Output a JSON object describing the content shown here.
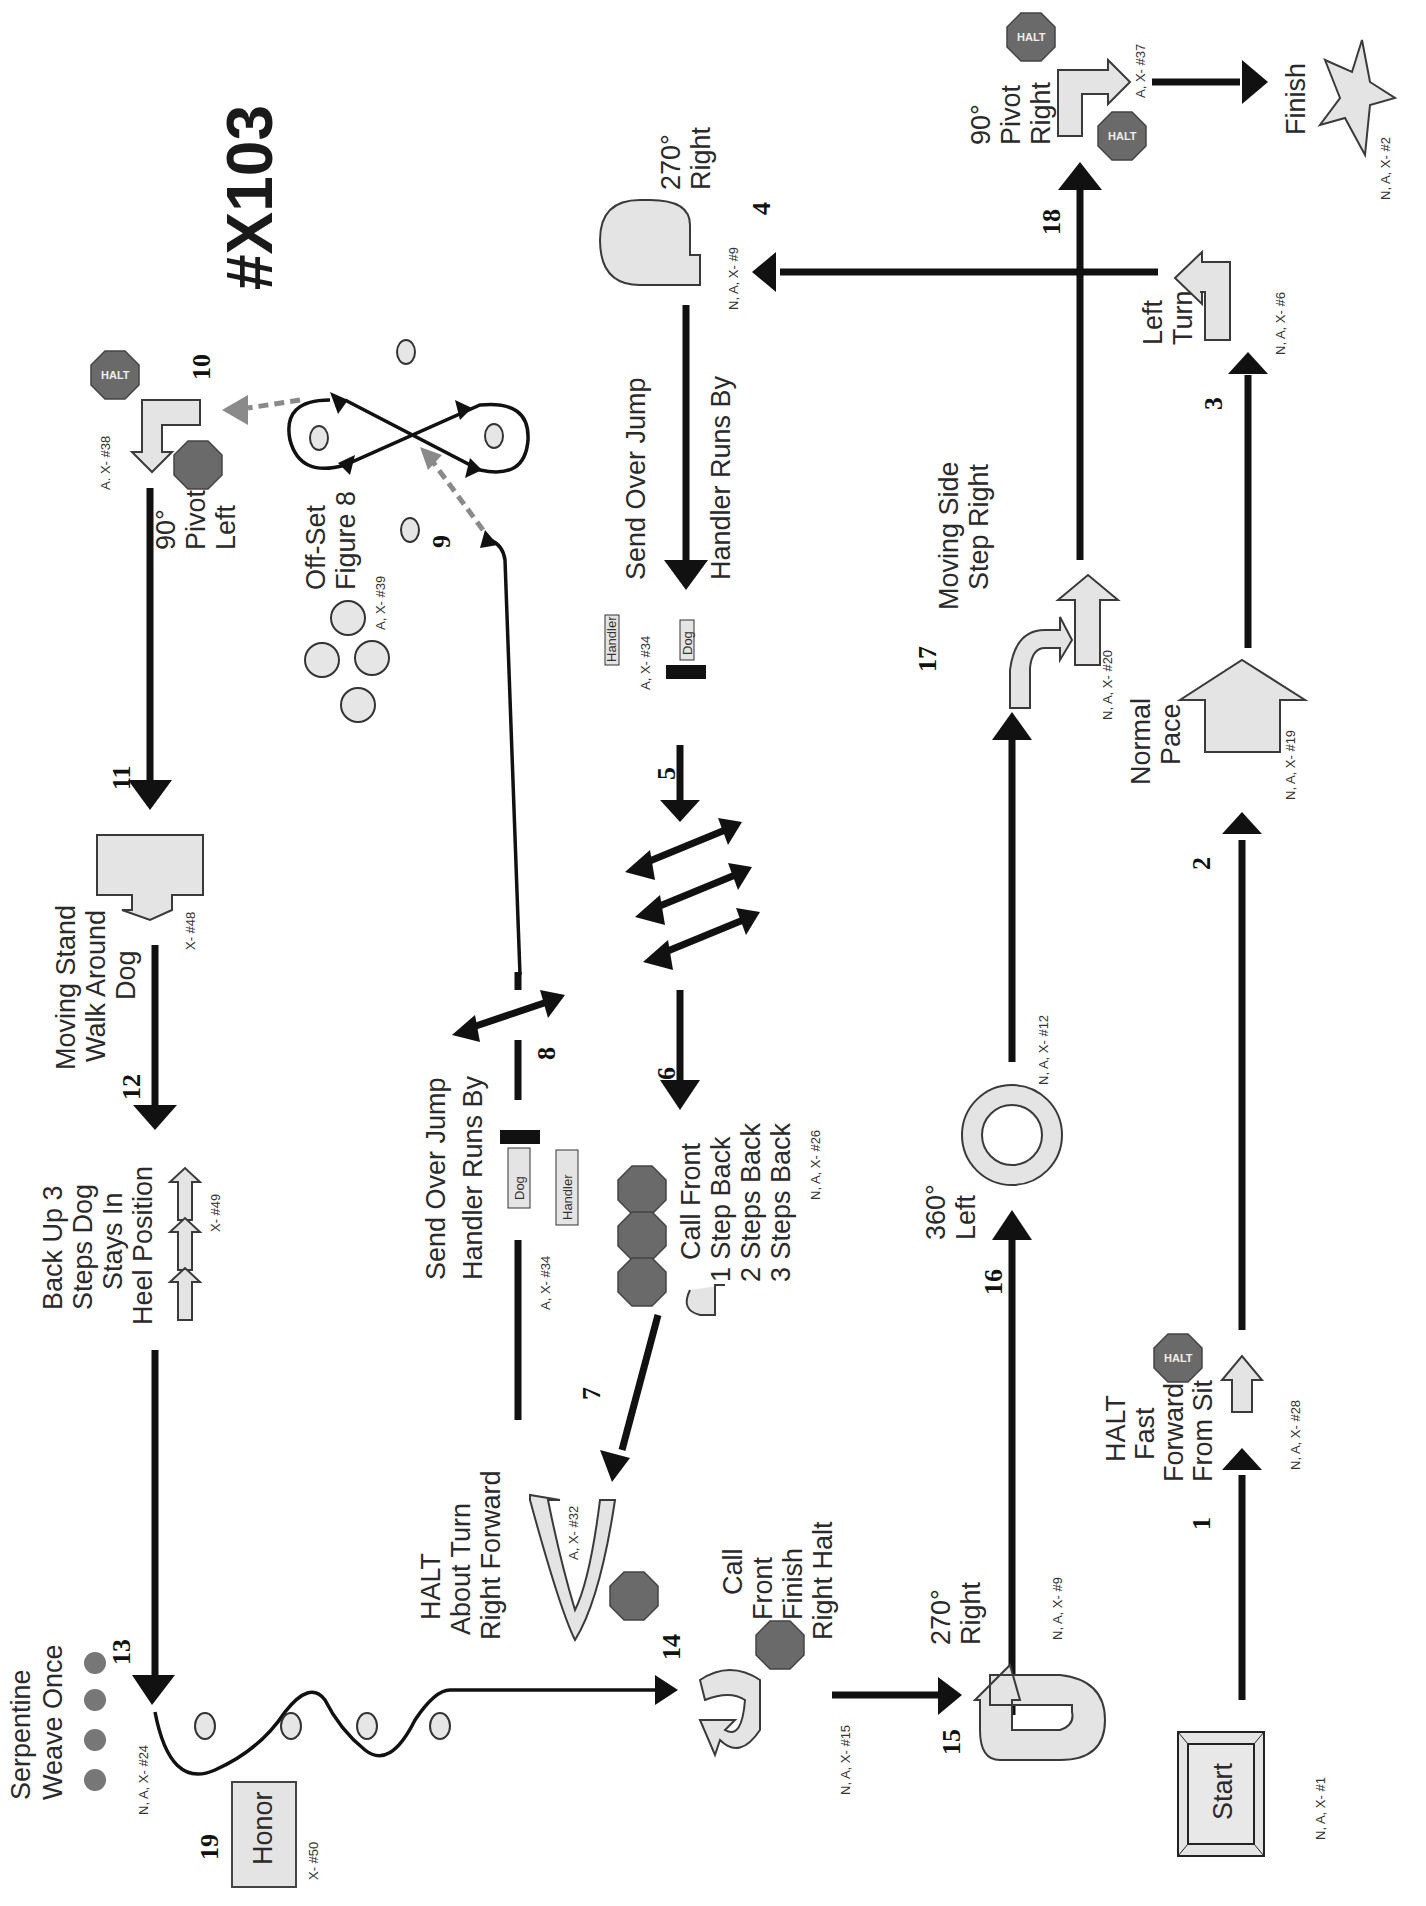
{
  "title": "#X103",
  "stations": [
    {
      "num": "1",
      "label": [
        "HALT",
        "Fast",
        "Forward",
        "From Sit"
      ],
      "code": "N, A, X- #28"
    },
    {
      "num": "2",
      "label": [
        "Normal",
        "Pace"
      ],
      "code": "N, A, X- #19"
    },
    {
      "num": "3",
      "label": [
        "Left",
        "Turn"
      ],
      "code": "N, A, X- #6"
    },
    {
      "num": "4",
      "label": [
        "270°",
        "Right"
      ],
      "code": "N, A, X- #9"
    },
    {
      "num": "5",
      "label": [
        "Send Over Jump",
        "Handler Runs By"
      ],
      "code": "A, X- #34"
    },
    {
      "num": "6",
      "label": [
        "Call Front",
        "1 Step Back",
        "2 Steps Back",
        "3 Steps Back"
      ],
      "code": "N, A, X- #26"
    },
    {
      "num": "7",
      "label": [
        "HALT",
        "About Turn",
        "Right Forward"
      ],
      "code": "A, X- #32"
    },
    {
      "num": "8",
      "label": [
        "Send Over Jump",
        "Handler Runs By"
      ],
      "code": "A, X- #34"
    },
    {
      "num": "9",
      "label": [
        "Off-Set",
        "Figure 8"
      ],
      "code": "A, X- #39"
    },
    {
      "num": "10",
      "label": [
        "90°",
        "Pivot",
        "Left"
      ],
      "code": "A. X- #38"
    },
    {
      "num": "11",
      "label": [
        "Moving Stand",
        "Walk Around",
        "Dog"
      ],
      "code": "X- #48"
    },
    {
      "num": "12",
      "label": [
        "Back Up 3",
        "Steps Dog",
        "Stays In",
        "Heel Position"
      ],
      "code": "X- #49"
    },
    {
      "num": "13",
      "label": [
        "Serpentine",
        "Weave Once"
      ],
      "code": "N, A, X- #24"
    },
    {
      "num": "14",
      "label": [
        "Call",
        "Front",
        "Finish",
        "Right Halt"
      ],
      "code": "N, A, X- #15"
    },
    {
      "num": "15",
      "label": [
        "270°",
        "Right"
      ],
      "code": "N, A, X- #9"
    },
    {
      "num": "16",
      "label": [
        "360°",
        "Left"
      ],
      "code": "N, A, X- #12"
    },
    {
      "num": "17",
      "label": [
        "Moving Side",
        "Step Right"
      ],
      "code": "N, A, X- #20"
    },
    {
      "num": "18",
      "label": [
        "90°",
        "Pivot",
        "Right"
      ],
      "code": "A, X- #37"
    },
    {
      "num": "19",
      "label": [
        "Honor"
      ],
      "code": "X- #50"
    }
  ],
  "start": {
    "label": "Start",
    "code": "N, A, X- #1"
  },
  "finish": {
    "label": "Finish",
    "code": "N, A, X- #2"
  },
  "jump_tags": {
    "dog": "Dog",
    "handler": "Handler"
  },
  "halt_text": "HALT",
  "colors": {
    "sign_fill": "#e4e4e4",
    "halt_fill": "#6a6a6a",
    "path": "#111111",
    "dashed": "#8a8a8a"
  }
}
